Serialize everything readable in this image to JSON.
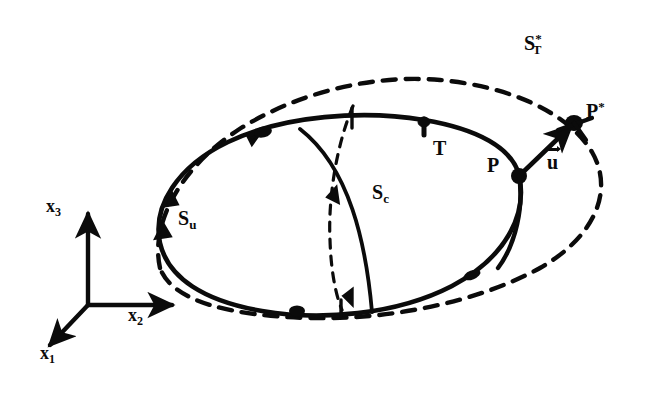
{
  "figure": {
    "kind": "continuum-mechanics-deformation-diagram",
    "background_color": "#ffffff",
    "ink_color": "#0b0b0b"
  },
  "axes": {
    "origin_label": "",
    "items": [
      {
        "name": "x3",
        "base": "x",
        "sub": "3",
        "direction": "up",
        "x": 46,
        "y": 200
      },
      {
        "name": "x2",
        "base": "x",
        "sub": "2",
        "direction": "right",
        "x": 128,
        "y": 306
      },
      {
        "name": "x1",
        "base": "x",
        "sub": "1",
        "direction": "down-left",
        "x": 40,
        "y": 348
      }
    ]
  },
  "labels": {
    "s_u": {
      "base": "S",
      "sub": "u",
      "sup": "",
      "x": 178,
      "y": 210,
      "title": "displacement boundary surface"
    },
    "s_c": {
      "base": "S",
      "sub": "c",
      "sup": "",
      "x": 372,
      "y": 184,
      "title": "cut / cross-section surface"
    },
    "s_t_star": {
      "base": "S",
      "sub": "T",
      "sup": "*",
      "x": 524,
      "y": 30,
      "title": "traction boundary surface, deformed"
    },
    "p": {
      "base": "P",
      "sub": "",
      "sup": "",
      "x": 487,
      "y": 156,
      "title": "material point, undeformed"
    },
    "p_star": {
      "base": "P",
      "sub": "",
      "sup": "*",
      "x": 584,
      "y": 100,
      "title": "material point, deformed"
    },
    "traction": {
      "base": "T",
      "sub": "",
      "sup": "",
      "x": 432,
      "y": 136,
      "title": "traction vector"
    },
    "displacement": {
      "base": "u",
      "sub": "",
      "sup": "",
      "x": 547,
      "y": 151,
      "title": "displacement vector"
    }
  },
  "curves": {
    "undeformed_outline": {
      "style": "solid",
      "width": 4.2,
      "note": "original body boundary"
    },
    "deformed_outline": {
      "style": "dashed",
      "width": 4.2,
      "dash": "13 10",
      "note": "deformed body boundary"
    },
    "cut_front": {
      "style": "solid",
      "width": 3.6,
      "note": "visible cross-section arc"
    },
    "cut_back": {
      "style": "dashed",
      "width": 3.2,
      "dash": "9 8",
      "note": "hidden cross-section arc"
    }
  },
  "markers": {
    "point_p": {
      "x": 519,
      "y": 175
    },
    "point_p_star": {
      "x": 574,
      "y": 123
    },
    "node_top_left": {
      "x": 262,
      "y": 130
    },
    "node_bottom": {
      "x": 296,
      "y": 310
    }
  }
}
